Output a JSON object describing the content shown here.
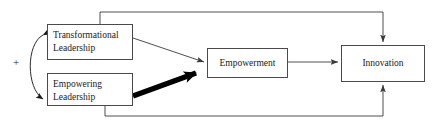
{
  "diagram": {
    "type": "conceptual-research-model",
    "title": "",
    "nodes": [
      {
        "id": "transformational-leadership",
        "label": "Transformational\nLeadership",
        "align": "left"
      },
      {
        "id": "empowering-leadership",
        "label": "Empowering\nLeadership",
        "align": "left"
      },
      {
        "id": "empowerment",
        "label": "Empowerment",
        "align": "center"
      },
      {
        "id": "innovation",
        "label": "Innovation",
        "align": "center"
      }
    ],
    "annotations": {
      "correlation_sign": "+"
    },
    "edges": [
      {
        "id": "correlation",
        "from": "transformational-leadership",
        "to": "empowering-leadership",
        "style": "curved-double-headed",
        "label": "+",
        "weight": "thin"
      },
      {
        "id": "tl-to-empowerment",
        "from": "transformational-leadership",
        "to": "empowerment",
        "style": "straight",
        "weight": "thin"
      },
      {
        "id": "el-to-empowerment",
        "from": "empowering-leadership",
        "to": "empowerment",
        "style": "straight",
        "weight": "thick"
      },
      {
        "id": "empowerment-to-innovation",
        "from": "empowerment",
        "to": "innovation",
        "style": "straight",
        "weight": "thin"
      },
      {
        "id": "tl-to-innovation",
        "from": "transformational-leadership",
        "to": "innovation",
        "style": "orthogonal-top",
        "weight": "thin"
      },
      {
        "id": "el-to-innovation",
        "from": "empowering-leadership",
        "to": "innovation",
        "style": "orthogonal-bottom",
        "weight": "thin"
      }
    ],
    "colors": {
      "line": "#4a4a4a",
      "thick_line": "#000000",
      "box_border": "#4a4a4a",
      "text": "#1a1a1a",
      "background": "#ffffff"
    }
  }
}
